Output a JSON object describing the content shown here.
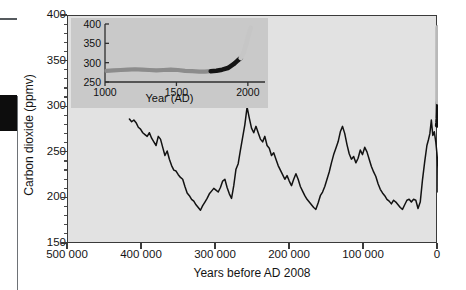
{
  "figure": {
    "background_color": "#ffffff",
    "plot_background_color": "#e2e2e2",
    "inset_background_color": "#c9c9c9",
    "line_color": "#121212",
    "axis_color": "#3a3a3a"
  },
  "chart_data": {
    "type": "line",
    "title": "",
    "xlabel": "Years before AD 2008",
    "ylabel": "Carbon dioxide (ppmv)",
    "xlim": [
      500000,
      0
    ],
    "ylim": [
      150,
      400
    ],
    "x_reversed": true,
    "grid": false,
    "legend": "none",
    "xticks": [
      500000,
      400000,
      300000,
      200000,
      100000,
      0
    ],
    "xtick_labels": [
      "500 000",
      "400 000",
      "300 000",
      "200 000",
      "100 000",
      "0"
    ],
    "yticks": [
      150,
      200,
      250,
      300,
      350,
      400
    ],
    "ytick_labels": [
      "150",
      "200",
      "250",
      "300",
      "350",
      "400"
    ],
    "y_minor_interval": 10,
    "series": [
      {
        "name": "Ice-core carbon dioxide record",
        "color": "#121212",
        "x": [
          417000,
          414000,
          411000,
          408000,
          405000,
          402000,
          399000,
          396000,
          393000,
          390000,
          387000,
          384000,
          381000,
          378000,
          375000,
          372000,
          369000,
          366000,
          363000,
          360000,
          357000,
          354000,
          351000,
          348000,
          345000,
          342000,
          339000,
          336000,
          333000,
          330000,
          327000,
          324000,
          321000,
          318000,
          315000,
          312000,
          309000,
          306000,
          303000,
          300000,
          297000,
          294000,
          291000,
          288000,
          285000,
          282000,
          279000,
          276000,
          273000,
          270000,
          267000,
          264000,
          261000,
          258000,
          255000,
          252000,
          249000,
          246000,
          243000,
          240000,
          237000,
          234000,
          231000,
          228000,
          225000,
          222000,
          219000,
          216000,
          213000,
          210000,
          207000,
          204000,
          201000,
          198000,
          195000,
          192000,
          189000,
          186000,
          183000,
          180000,
          177000,
          174000,
          171000,
          168000,
          165000,
          162000,
          159000,
          156000,
          153000,
          150000,
          147000,
          144000,
          141000,
          138000,
          135000,
          132000,
          129000,
          126000,
          123000,
          120000,
          117000,
          114000,
          111000,
          108000,
          105000,
          102000,
          99000,
          96000,
          93000,
          90000,
          87000,
          84000,
          81000,
          78000,
          75000,
          72000,
          69000,
          66000,
          63000,
          60000,
          57000,
          54000,
          51000,
          48000,
          45000,
          42000,
          39000,
          36000,
          33000,
          30000,
          27000,
          24000,
          21000,
          18000,
          15000,
          13000,
          11000,
          9000,
          7000,
          5000,
          3000,
          1500,
          500,
          200,
          100,
          50
        ],
        "y": [
          287,
          284,
          286,
          283,
          278,
          276,
          272,
          270,
          268,
          272,
          266,
          262,
          258,
          268,
          265,
          256,
          247,
          252,
          243,
          236,
          231,
          230,
          226,
          223,
          221,
          213,
          206,
          203,
          199,
          197,
          193,
          190,
          187,
          192,
          196,
          200,
          205,
          208,
          211,
          209,
          207,
          212,
          219,
          221,
          212,
          205,
          200,
          214,
          232,
          238,
          253,
          267,
          281,
          300,
          288,
          277,
          272,
          279,
          272,
          265,
          262,
          268,
          258,
          255,
          247,
          250,
          243,
          236,
          231,
          226,
          221,
          225,
          219,
          214,
          221,
          227,
          221,
          213,
          208,
          203,
          199,
          196,
          193,
          190,
          188,
          195,
          203,
          207,
          213,
          221,
          229,
          239,
          248,
          255,
          262,
          273,
          279,
          271,
          259,
          249,
          243,
          246,
          239,
          244,
          253,
          248,
          256,
          251,
          243,
          235,
          229,
          224,
          216,
          210,
          206,
          203,
          199,
          197,
          194,
          198,
          196,
          193,
          190,
          188,
          193,
          198,
          199,
          196,
          199,
          198,
          189,
          196,
          220,
          240,
          258,
          264,
          271,
          286,
          269,
          273,
          262,
          250,
          240,
          233,
          219,
          207
        ],
        "note": "Antarctic ice-core CO2 over the last ~420 000 years"
      },
      {
        "name": "Recent instrumental rise (bold black)",
        "color": "#111111",
        "x": [
          1200,
          800,
          400,
          200,
          100,
          50,
          20
        ],
        "y": [
          280,
          283,
          288,
          295,
          300,
          303,
          306
        ]
      },
      {
        "name": "Modern / projected rise (light grey)",
        "color": "#b9b9b9",
        "x": [
          40,
          20,
          10,
          0
        ],
        "y": [
          306,
          330,
          360,
          387
        ]
      }
    ]
  },
  "inset": {
    "xlabel": "Year (AD)",
    "xlim": [
      1000,
      2050
    ],
    "ylim": [
      250,
      400
    ],
    "xticks": [
      1000,
      1500,
      2000
    ],
    "xtick_labels": [
      "1000",
      "1500",
      "2000"
    ],
    "yticks": [
      250,
      300,
      350,
      400
    ],
    "ytick_labels": [
      "250",
      "300",
      "350",
      "400"
    ],
    "series": [
      {
        "name": "Pre-industrial ice-core CO2 (medium grey)",
        "color": "#8c8c8c",
        "x": [
          1010,
          1060,
          1110,
          1160,
          1210,
          1260,
          1310,
          1360,
          1410,
          1460,
          1510,
          1560,
          1610,
          1660,
          1700,
          1740
        ],
        "y": [
          279,
          280,
          281,
          282,
          283,
          282,
          281,
          280,
          281,
          282,
          281,
          279,
          278,
          277,
          277,
          278
        ]
      },
      {
        "name": "Industrial era CO2 (black)",
        "color": "#141414",
        "x": [
          1740,
          1780,
          1820,
          1860,
          1900,
          1930,
          1950
        ],
        "y": [
          278,
          279,
          282,
          286,
          296,
          306,
          312
        ]
      },
      {
        "name": "Modern CO2 rise (light grey)",
        "color": "#c6c6c6",
        "x": [
          1950,
          1970,
          1990,
          2005,
          2020
        ],
        "y": [
          312,
          326,
          350,
          372,
          390
        ]
      }
    ]
  },
  "artifacts": {
    "page_edge_dash": "scan-edge-dash",
    "page_edge_block": "scan-edge-block",
    "page_edge_rule": "scan-edge-rule"
  }
}
